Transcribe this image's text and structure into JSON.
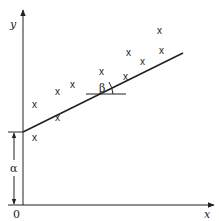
{
  "diagram": {
    "type": "linear regression illustration",
    "axes": {
      "x_label": "x",
      "y_label": "y",
      "origin_label": "0"
    },
    "intercept_label": "α",
    "slope_angle_label": "β",
    "point_marker": "x",
    "points": [
      {
        "x": 35,
        "y": 138
      },
      {
        "x": 35,
        "y": 105
      },
      {
        "x": 58,
        "y": 118
      },
      {
        "x": 58,
        "y": 92
      },
      {
        "x": 73,
        "y": 85
      },
      {
        "x": 102,
        "y": 72
      },
      {
        "x": 126,
        "y": 77
      },
      {
        "x": 129,
        "y": 53
      },
      {
        "x": 143,
        "y": 62
      },
      {
        "x": 160,
        "y": 31
      },
      {
        "x": 162,
        "y": 51
      }
    ],
    "colors": {
      "ink": "#222222",
      "background": "#ffffff"
    }
  }
}
